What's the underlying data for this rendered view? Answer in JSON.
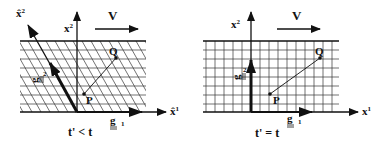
{
  "figure": {
    "panels": [
      {
        "id": "left",
        "caption": "t' < t",
        "axes": {
          "horizontal_label": "x̂",
          "horizontal_sup": "1",
          "vertical_label": "x",
          "vertical_sup": "2",
          "oblique_label": "x̂",
          "oblique_sup": "2"
        },
        "basis": {
          "g1_label": "g",
          "g1_sub": "1",
          "g2_label": "g",
          "g2_sub": "2"
        },
        "points": {
          "P": "P",
          "Q": "Q"
        },
        "velocity_label": "V",
        "grid": "oblique"
      },
      {
        "id": "right",
        "caption": "t' = t",
        "axes": {
          "horizontal_label": "x",
          "horizontal_sup": "1",
          "vertical_label": "x",
          "vertical_sup": "2"
        },
        "basis": {
          "g1_label": "g",
          "g1_sub": "1",
          "g2_label": "g",
          "g2_sub": "2"
        },
        "points": {
          "P": "P",
          "Q": "Q"
        },
        "velocity_label": "V",
        "grid": "orthogonal"
      }
    ],
    "colors": {
      "ink": "#111111",
      "background": "#ffffff"
    }
  }
}
